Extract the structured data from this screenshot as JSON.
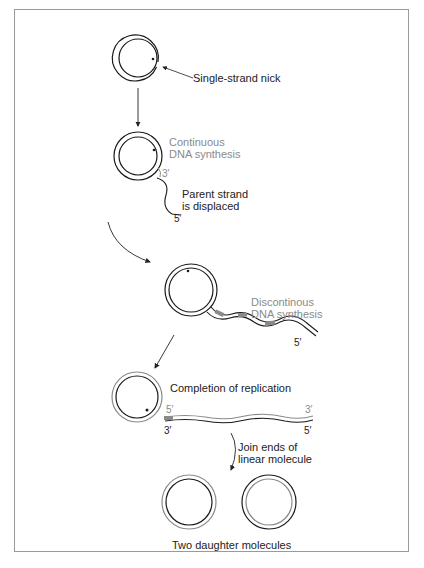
{
  "labels": {
    "nick": "Single-strand nick",
    "continuous_1": "Continuous",
    "continuous_2": "DNA synthesis",
    "three_prime_a": "3′",
    "parent_1": "Parent strand",
    "parent_2": "is displaced",
    "five_prime_a": "5′",
    "discontinuous_1": "Discontinous",
    "discontinuous_2": "DNA synthesis",
    "five_prime_b": "5′",
    "completion": "Completion of replication",
    "linear_5_left": "5′",
    "linear_3_right": "3′",
    "linear_3_left": "3′",
    "linear_5_right": "5′",
    "join_1": "Join ends of",
    "join_2": "linear molecule",
    "daughters": "Two daughter molecules"
  },
  "colors": {
    "parent_strand": "#1a1a1a",
    "new_strand": "#8a8a8a",
    "frame": "#9a9a9a"
  },
  "steps": [
    {
      "id": 1,
      "description": "Circular DNA with single-strand nick"
    },
    {
      "id": 2,
      "description": "Continuous DNA synthesis; parent strand displaced"
    },
    {
      "id": 3,
      "description": "Discontinuous DNA synthesis on displaced strand"
    },
    {
      "id": 4,
      "description": "Completion of replication"
    },
    {
      "id": 5,
      "description": "Join ends of linear molecule; two daughter molecules"
    }
  ]
}
